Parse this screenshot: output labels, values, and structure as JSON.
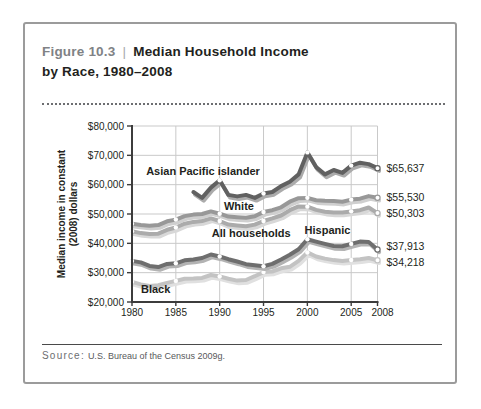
{
  "figure": {
    "label": "Figure 10.3",
    "separator": "|",
    "title_line1": "Median Household Income",
    "title_line2": "by Race, 1980–2008"
  },
  "source": {
    "prefix": "Source:",
    "text": "U.S. Bureau of the Census 2009g."
  },
  "colors": {
    "axis": "#3c3c3c",
    "grid": "#c9c9c9",
    "text": "#231f20",
    "figure_label_gray": "#808285",
    "border_gray": "#9b9b9b"
  },
  "chart_data": {
    "type": "line",
    "title": "Median Household Income by Race, 1980–2008",
    "ylabel_line1": "Median income in constant",
    "ylabel_line2": "(2008) dollars",
    "xlabel": "",
    "xlim": [
      1980,
      2008
    ],
    "ylim": [
      20000,
      80000
    ],
    "grid": true,
    "x_ticks": [
      1980,
      1985,
      1990,
      1995,
      2000,
      2005,
      2008
    ],
    "y_tick_values": [
      80000,
      70000,
      60000,
      50000,
      40000,
      30000,
      20000
    ],
    "y_tick_labels": [
      "$80,000",
      "$70,000",
      "$60,000",
      "$50,000",
      "$40,000",
      "$30,000",
      "$20,000"
    ],
    "marker_years": [
      1980,
      1985,
      1990,
      1995,
      2000,
      2005
    ],
    "series": [
      {
        "name": "Asian Pacific islander",
        "color": "#616161",
        "shadow_color": "#ababab",
        "start_year": 1987,
        "end_label": "$65,637",
        "label_dy": 0,
        "values": [
          57500,
          55500,
          59000,
          61500,
          56500,
          56000,
          56500,
          55500,
          57000,
          57500,
          59500,
          61000,
          63500,
          71000,
          66000,
          63500,
          65000,
          64000,
          66500,
          67500,
          67000,
          65637
        ]
      },
      {
        "name": "White",
        "color": "#989898",
        "shadow_color": "#cfcfcf",
        "start_year": 1980,
        "end_label": "$55,530",
        "label_dy": 0,
        "values": [
          46700,
          46300,
          46000,
          46200,
          47500,
          48100,
          49300,
          49800,
          50000,
          50900,
          50100,
          49100,
          48900,
          48700,
          49200,
          50700,
          51300,
          52300,
          54200,
          55400,
          55500,
          54700,
          54500,
          54400,
          54200,
          54900,
          55200,
          56100,
          55530
        ]
      },
      {
        "name": "All households",
        "color": "#ababab",
        "shadow_color": "#d8d8d8",
        "start_year": 1980,
        "end_label": "$50,303",
        "label_dy": 0,
        "values": [
          44100,
          43500,
          43200,
          43300,
          44600,
          45400,
          46700,
          47300,
          47600,
          48500,
          47600,
          46400,
          46100,
          45800,
          46400,
          47600,
          48500,
          49500,
          51300,
          52600,
          52500,
          51400,
          50800,
          50500,
          50500,
          50900,
          51300,
          52200,
          50303
        ]
      },
      {
        "name": "Hispanic",
        "color": "#6e6e6e",
        "shadow_color": "#b3b3b3",
        "start_year": 1980,
        "end_label": "$37,913",
        "label_dy": -3,
        "values": [
          34000,
          33500,
          32300,
          31900,
          33000,
          33200,
          34200,
          34500,
          35000,
          36200,
          35500,
          34600,
          33800,
          32900,
          32500,
          32200,
          33000,
          34500,
          36100,
          38000,
          41400,
          40600,
          39800,
          39100,
          39000,
          39800,
          40600,
          40500,
          37913
        ]
      },
      {
        "name": "Black",
        "color": "#c3c3c3",
        "shadow_color": "#e0e0e0",
        "start_year": 1980,
        "end_label": "$34,218",
        "label_dy": 2,
        "values": [
          26900,
          26000,
          25500,
          25700,
          26500,
          27200,
          27900,
          28000,
          28200,
          29200,
          28700,
          27900,
          27300,
          27500,
          28800,
          30200,
          30400,
          31500,
          32000,
          34000,
          36900,
          35500,
          34800,
          34300,
          34000,
          34300,
          34600,
          35000,
          34218
        ]
      }
    ],
    "annotations": [
      {
        "text": "Asian Pacific islander",
        "year": 1988.1,
        "value": 64500
      },
      {
        "text": "White",
        "year": 1992.2,
        "value": 52800
      },
      {
        "text": "All households",
        "year": 1993.6,
        "value": 43500
      },
      {
        "text": "Hispanic",
        "year": 2002.3,
        "value": 44400
      },
      {
        "text": "Black",
        "year": 1982.7,
        "value": 24300
      }
    ]
  }
}
